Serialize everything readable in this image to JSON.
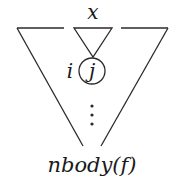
{
  "diagram": {
    "type": "tree-schematic",
    "top_label": "x",
    "node_index_label": "i",
    "node_label": "j",
    "ellipsis": "⋮",
    "bottom_label": "nbody(f)",
    "colors": {
      "stroke": "#2a2a2a",
      "text": "#1a1a1a",
      "background": "#ffffff"
    }
  }
}
